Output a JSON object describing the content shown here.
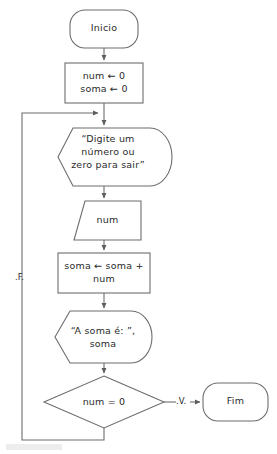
{
  "diagram": {
    "language": "pt-BR",
    "background_color": "#ffffff",
    "stroke_color": "#6d6d6d",
    "text_color": "#2b2b2b",
    "nodes": {
      "start": {
        "label": "Inicio",
        "shape": "terminator"
      },
      "init": {
        "line1": "num ← 0",
        "line2": "soma ← 0",
        "shape": "process"
      },
      "prompt": {
        "line1": "“Digite um",
        "line2": "número ou",
        "line3": "zero para sair”",
        "shape": "display"
      },
      "read": {
        "label": "num",
        "shape": "input-trapezoid"
      },
      "accumulate": {
        "line1": "soma ← soma +",
        "line2": "num",
        "shape": "process"
      },
      "output": {
        "line1": "“A soma é: ”,",
        "line2": "soma",
        "shape": "display"
      },
      "decision": {
        "label": "num = 0",
        "shape": "decision"
      },
      "end": {
        "label": "Fim",
        "shape": "terminator"
      }
    },
    "edges": {
      "true_label": ".V.",
      "false_label": ".F."
    }
  }
}
